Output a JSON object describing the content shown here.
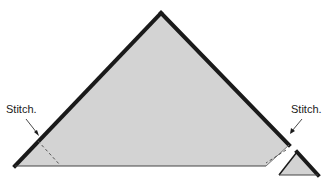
{
  "diagram": {
    "labels": {
      "left_stitch": "Stitch.",
      "right_stitch": "Stitch."
    },
    "colors": {
      "fabric_fill": "#d3d3d3",
      "edge_stroke": "#1a1a1a",
      "stitch_line": "#555555",
      "background": "#ffffff"
    },
    "shapes": [
      {
        "name": "large-triangle",
        "description": "Large triangle with right corner trimmed off"
      },
      {
        "name": "small-triangle",
        "description": "Trimmed-off corner triangle"
      }
    ]
  }
}
